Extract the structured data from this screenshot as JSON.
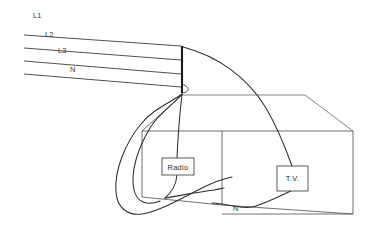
{
  "diagram": {
    "supply_lines": [
      {
        "id": "L1",
        "label": "L1",
        "label_x": 33,
        "label_y": 16
      },
      {
        "id": "L2",
        "label": "L2",
        "label_x": 44,
        "label_y": 34
      },
      {
        "id": "L3",
        "label": "L3",
        "label_x": 58,
        "label_y": 50
      },
      {
        "id": "N",
        "label": "N",
        "label_x": 70,
        "label_y": 70
      }
    ],
    "devices": [
      {
        "id": "radio",
        "label": "Radio",
        "x": 162,
        "y": 158,
        "w": 31,
        "h": 17
      },
      {
        "id": "tv",
        "label": "T.V.",
        "x": 277,
        "y": 166,
        "w": 30,
        "h": 25
      }
    ],
    "floor_labels": [
      {
        "id": "neutral-floor",
        "label": "N",
        "x": 233,
        "y": 209
      }
    ],
    "colors": {
      "background": "#ffffff",
      "supply_line": "#3d3d3d",
      "mast": "#1a1a1a",
      "room_edge": "#6e6e6e",
      "cable": "#2e2e2e",
      "text": "#3a3a3a"
    },
    "geometry": {
      "mast": {
        "x": 182,
        "y_top": 46,
        "y_bottom": 93
      },
      "supply_paths": [
        "M 24 35 L 182 46",
        "M 24 48 L 182 60",
        "M 24 61 L 182 74",
        "M 24 74 L 182 87"
      ],
      "supply_curve_hook": "M 182 87 C 188 89 189 92 182 93",
      "room": {
        "back_top": "M 182 95 L 305 95",
        "back_top_right": "M 305 95 L 352 131",
        "left_ridge": "M 182 95 L 142 131",
        "front_top": "M 142 131 L 222 131 L 222 131",
        "front_face_top": "M 222 131 L 352 131",
        "front_left_vertical": "M 142 131 L 142 197",
        "front_mid_vertical": "M 222 131 L 222 205",
        "right_vertical": "M 352 131 L 352 214",
        "floor_front": "M 142 197 L 222 205",
        "floor_right": "M 222 205 L 352 214",
        "floor_bottom": "M 222 214 L 352 214"
      },
      "cables": [
        "M 182 93 C 170 110 150 118 140 140 C 130 162 118 186 124 205 C 130 220 150 218 165 206 C 185 190 205 180 222 176",
        "M 182 93 C 180 112 178 132 177 158",
        "M 177 175 C 176 186 170 196 160 202",
        "M 182 93 C 160 100 146 112 142 131",
        "M 182 46 C 215 58 245 80 262 110 C 276 136 286 158 292 166",
        "M 222 205 C 240 206 252 212 262 206 C 272 200 282 196 292 191"
      ]
    }
  }
}
